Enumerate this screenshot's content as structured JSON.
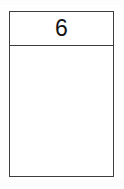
{
  "document": {
    "type": "table-cell-diagram",
    "background_color": "#ffffff"
  },
  "table": {
    "border_color": "#3d3d3d",
    "fill_color": "#ffffff",
    "header": {
      "value": "6",
      "text_color": "#141414",
      "align": "center"
    },
    "body": {
      "value": "",
      "content": "empty"
    }
  }
}
